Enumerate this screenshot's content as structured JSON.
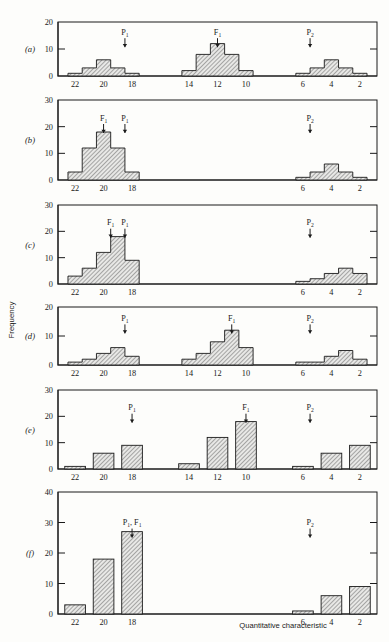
{
  "figure": {
    "xlabel": "Quantitative characteristic",
    "ylabel": "Frequency",
    "hatch_color": "#8d8d8d",
    "line_color": "#1a1a1a",
    "background": "#fdfdfb"
  },
  "chart_data": {
    "type": "bar",
    "title": "",
    "xlabel": "Quantitative characteristic",
    "ylabel": "Frequency",
    "grid": false,
    "legend": false,
    "x_axis_direction": "descending",
    "x_tick_values": [
      22,
      20,
      18,
      14,
      12,
      10,
      6,
      4,
      2
    ],
    "panels": [
      {
        "label": "(a)",
        "ylim": [
          0,
          20
        ],
        "yticks": [
          0,
          10,
          20
        ],
        "style": "histogram",
        "markers": [
          {
            "text": "P",
            "sub": "1",
            "x": 18.5
          },
          {
            "text": "F",
            "sub": "1",
            "x": 12
          },
          {
            "text": "P",
            "sub": "2",
            "x": 5.5
          }
        ],
        "groups": [
          {
            "name": "P1-parent",
            "x": [
              22,
              21,
              20,
              19,
              18
            ],
            "values": [
              1,
              3,
              6,
              3,
              1
            ]
          },
          {
            "name": "F1-hybrid",
            "x": [
              14,
              13,
              12,
              11,
              10
            ],
            "values": [
              2,
              8,
              12,
              8,
              2
            ]
          },
          {
            "name": "P2-parent",
            "x": [
              6,
              5,
              4,
              3,
              2
            ],
            "values": [
              1,
              3,
              6,
              3,
              1
            ]
          }
        ]
      },
      {
        "label": "(b)",
        "ylim": [
          0,
          30
        ],
        "yticks": [
          0,
          10,
          20,
          30
        ],
        "style": "histogram",
        "markers": [
          {
            "text": "F",
            "sub": "1",
            "x": 20
          },
          {
            "text": "P",
            "sub": "1",
            "x": 18.5
          },
          {
            "text": "P",
            "sub": "2",
            "x": 5.5
          }
        ],
        "groups": [
          {
            "name": "P1-F1-overlap",
            "x": [
              22,
              21,
              20,
              19,
              18
            ],
            "values": [
              3,
              12,
              18,
              12,
              3
            ]
          },
          {
            "name": "P2-parent",
            "x": [
              6,
              5,
              4,
              3,
              2
            ],
            "values": [
              1,
              3,
              6,
              3,
              1
            ]
          }
        ]
      },
      {
        "label": "(c)",
        "ylim": [
          0,
          30
        ],
        "yticks": [
          0,
          10,
          20,
          30
        ],
        "style": "histogram",
        "markers": [
          {
            "text": "F",
            "sub": "1",
            "x": 19.5
          },
          {
            "text": "P",
            "sub": "1",
            "x": 18.5
          },
          {
            "text": "P",
            "sub": "2",
            "x": 5.5
          }
        ],
        "groups": [
          {
            "name": "P1-F1-skewed",
            "x": [
              22,
              21,
              20,
              19,
              18
            ],
            "values": [
              3,
              6,
              12,
              18,
              9
            ]
          },
          {
            "name": "P2-skewed",
            "x": [
              6,
              5,
              4,
              3,
              2
            ],
            "values": [
              1,
              2,
              4,
              6,
              4
            ]
          }
        ]
      },
      {
        "label": "(d)",
        "ylim": [
          0,
          20
        ],
        "yticks": [
          0,
          10,
          20
        ],
        "style": "histogram",
        "markers": [
          {
            "text": "P",
            "sub": "1",
            "x": 18.5
          },
          {
            "text": "F",
            "sub": "1",
            "x": 11
          },
          {
            "text": "P",
            "sub": "2",
            "x": 5.5
          }
        ],
        "groups": [
          {
            "name": "P1-parent",
            "x": [
              22,
              21,
              20,
              19,
              18
            ],
            "values": [
              1,
              2,
              4,
              6,
              3
            ]
          },
          {
            "name": "F1-skewed",
            "x": [
              14,
              13,
              12,
              11,
              10
            ],
            "values": [
              2,
              4,
              8,
              12,
              6
            ]
          },
          {
            "name": "P2-skewed",
            "x": [
              6,
              5,
              4,
              3,
              2
            ],
            "values": [
              1,
              1,
              3,
              5,
              2
            ]
          }
        ]
      },
      {
        "label": "(e)",
        "ylim": [
          0,
          30
        ],
        "yticks": [
          0,
          10,
          20,
          30
        ],
        "style": "bars",
        "markers": [
          {
            "text": "P",
            "sub": "1",
            "x": 18
          },
          {
            "text": "F",
            "sub": "1",
            "x": 10
          },
          {
            "text": "P",
            "sub": "2",
            "x": 5.5
          }
        ],
        "groups": [
          {
            "name": "P1-parent",
            "x": [
              22,
              20,
              18
            ],
            "values": [
              1,
              6,
              9
            ]
          },
          {
            "name": "F1-hybrid",
            "x": [
              14,
              12,
              10
            ],
            "values": [
              2,
              12,
              18
            ]
          },
          {
            "name": "P2-parent",
            "x": [
              6,
              4,
              2
            ],
            "values": [
              1,
              6,
              9
            ]
          }
        ]
      },
      {
        "label": "(f)",
        "ylim": [
          0,
          40
        ],
        "yticks": [
          0,
          10,
          20,
          30,
          40
        ],
        "style": "bars",
        "markers": [
          {
            "text": "P",
            "sub": "1",
            "text2": ", F",
            "sub2": "1",
            "x": 18
          },
          {
            "text": "P",
            "sub": "2",
            "x": 5.5
          }
        ],
        "groups": [
          {
            "name": "P1-F1-overlap",
            "x": [
              22,
              20,
              18
            ],
            "values": [
              3,
              18,
              27
            ]
          },
          {
            "name": "P2-parent",
            "x": [
              6,
              4,
              2
            ],
            "values": [
              1,
              6,
              9
            ]
          }
        ]
      }
    ]
  }
}
